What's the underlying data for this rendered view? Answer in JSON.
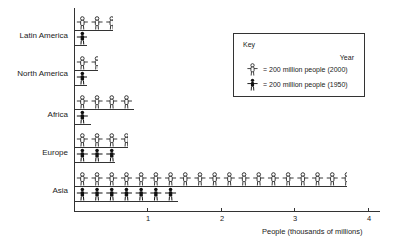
{
  "chart_data": {
    "type": "bar",
    "subtype": "pictograph",
    "title": "",
    "xlabel": "People (thousands of millions)",
    "ylabel": "",
    "xlim": [
      0,
      4.2
    ],
    "x_ticks": [
      "1",
      "2",
      "3",
      "4"
    ],
    "categories": [
      "Latin America",
      "North America",
      "Africa",
      "Europe",
      "Asia"
    ],
    "series": [
      {
        "name": "2000",
        "icon": "open-figure",
        "values": [
          0.52,
          0.31,
          0.8,
          0.72,
          3.7
        ]
      },
      {
        "name": "1950",
        "icon": "filled-figure",
        "values": [
          0.17,
          0.17,
          0.22,
          0.55,
          1.4
        ]
      }
    ],
    "unit_per_icon": "200 million people",
    "legend": {
      "title": "Key",
      "column_header": "Year",
      "entries": [
        {
          "icon": "open-figure",
          "label": "= 200 million people (2000)"
        },
        {
          "icon": "filled-figure",
          "label": "= 200 million people (1950)"
        }
      ],
      "position": "upper-right"
    },
    "grid": false
  },
  "labels": {
    "regions": [
      "Latin America",
      "North America",
      "Africa",
      "Europe",
      "Asia"
    ],
    "ticks": [
      "1",
      "2",
      "3",
      "4"
    ],
    "x_title": "People (thousands of millions)",
    "key_title": "Key",
    "key_year": "Year",
    "key_2000": "= 200 million people (2000)",
    "key_1950": "= 200 million people (1950)"
  }
}
